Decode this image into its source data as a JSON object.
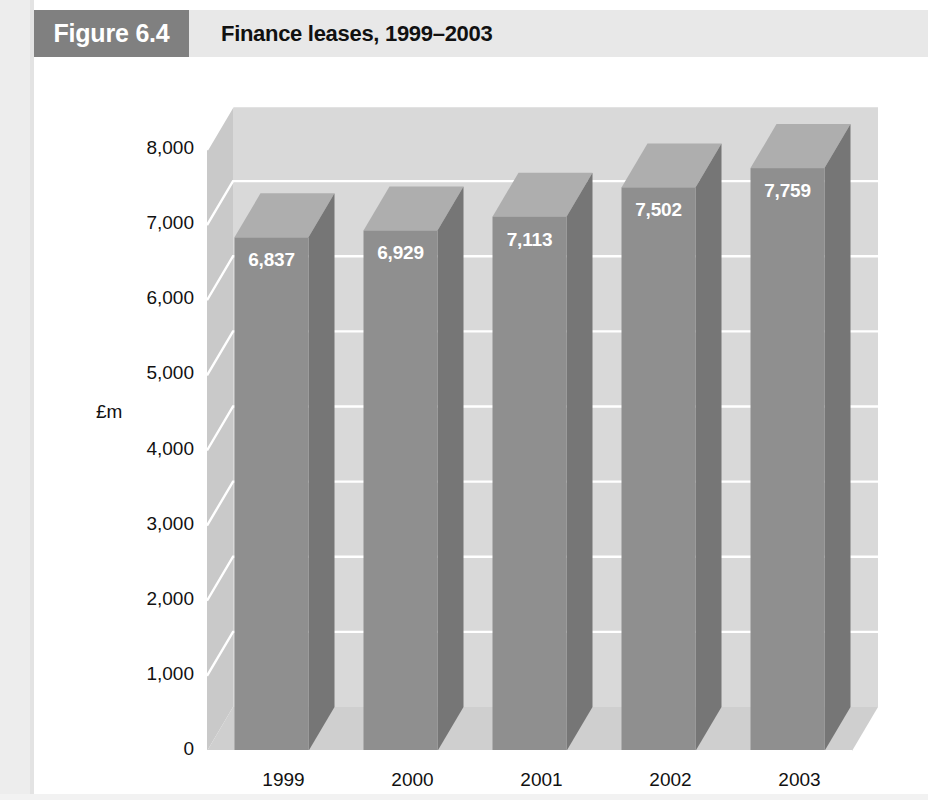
{
  "header": {
    "tag": "Figure 6.4",
    "title": "Finance leases, 1999–2003"
  },
  "chart_data": {
    "type": "bar",
    "title": "Finance leases, 1999–2003",
    "categories": [
      "1999",
      "2000",
      "2001",
      "2002",
      "2003"
    ],
    "values": [
      6837,
      6929,
      7113,
      7502,
      7759
    ],
    "value_labels": [
      "6,837",
      "6,929",
      "7,113",
      "7,502",
      "7,759"
    ],
    "xlabel": "",
    "ylabel": "£m",
    "ylim": [
      0,
      8000
    ],
    "ytick_values": [
      8000,
      7000,
      6000,
      5000,
      4000,
      3000,
      2000,
      1000,
      0
    ],
    "ytick_labels": [
      "8,000",
      "7,000",
      "6,000",
      "5,000",
      "4,000",
      "3,000",
      "2,000",
      "1,000",
      "0"
    ],
    "grid": true,
    "legend": "none",
    "style": "3d-column",
    "colors": {
      "bar_front": "#8f8f8f",
      "bar_side": "#767676",
      "bar_top": "#aeaeae",
      "back_wall": "#d9d9d9",
      "left_wall": "#c9c9c9",
      "floor": "#cfcfcf",
      "gridline": "#ffffff",
      "header_band": "#e8e8e8",
      "tag_box": "#808080",
      "text": "#111111",
      "value_text": "#ffffff"
    }
  }
}
